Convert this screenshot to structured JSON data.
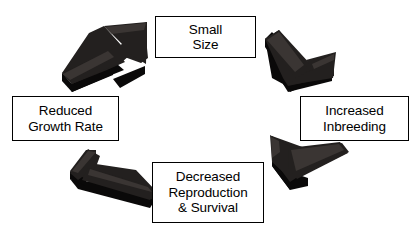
{
  "diagram": {
    "background_color": "#ffffff",
    "box_border_color": "#000000",
    "box_fill_color": "#ffffff",
    "text_color": "#000000",
    "arrow_top_color": "#23201f",
    "arrow_side_color": "#0a0909",
    "arrow_edge_color": "#3a3533",
    "flow_direction": "counter-clockwise",
    "nodes": [
      {
        "id": "small-size",
        "label": "Small\nSize",
        "position": "top"
      },
      {
        "id": "increased-inbreeding",
        "label": "Increased\nInbreeding",
        "position": "right"
      },
      {
        "id": "decreased-reproduction",
        "label": "Decreased\nReproduction\n& Survival",
        "position": "bottom"
      },
      {
        "id": "reduced-growth-rate",
        "label": "Reduced\nGrowth Rate",
        "position": "left"
      }
    ],
    "arrows": [
      {
        "id": "arrow-growth-to-small",
        "from": "reduced-growth-rate",
        "to": "small-size",
        "direction": "up-right",
        "quadrant": "top-left"
      },
      {
        "id": "arrow-small-to-inbreeding",
        "from": "small-size",
        "to": "increased-inbreeding",
        "direction": "down-right",
        "quadrant": "top-right"
      },
      {
        "id": "arrow-inbreeding-to-reproduction",
        "from": "increased-inbreeding",
        "to": "decreased-reproduction",
        "direction": "down-left",
        "quadrant": "bottom-right"
      },
      {
        "id": "arrow-reproduction-to-growth",
        "from": "decreased-reproduction",
        "to": "reduced-growth-rate",
        "direction": "up-left",
        "quadrant": "bottom-left"
      }
    ]
  }
}
